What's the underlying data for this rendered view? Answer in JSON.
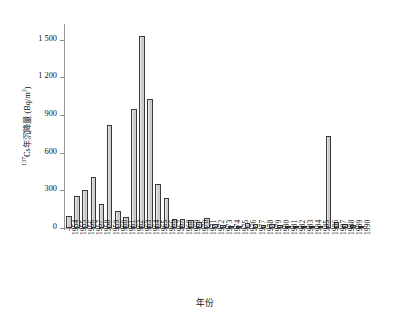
{
  "chart_data": {
    "type": "bar",
    "title": "",
    "xlabel": "年份",
    "ylabel": "¹³⁷Cs年沉降量 (Bq/m²)",
    "ylabel_parts": {
      "superscript": "137",
      "rest": "Cs年沉降量 (Bq/m",
      "unit_superscript": "2",
      "tail": ")"
    },
    "ylim": [
      0,
      1600
    ],
    "yticks": [
      0,
      300,
      600,
      900,
      1200,
      1500
    ],
    "ytick_labels": [
      "0",
      "300",
      "600",
      "900",
      "1 200",
      "1 500"
    ],
    "grid": false,
    "legend": null,
    "bar_fill_color": "#d2d2d2",
    "bar_edge_color": "#3a3a3a",
    "axis_color": "#9a9a9a",
    "categories": [
      "1954",
      "1955",
      "1956",
      "1957",
      "1958",
      "1959",
      "1960",
      "1961",
      "1962",
      "1963",
      "1964",
      "1965",
      "1966",
      "1967",
      "1968",
      "1969",
      "1970",
      "1971",
      "1972",
      "1973",
      "1974",
      "1975",
      "1976",
      "1977",
      "1978",
      "1979",
      "1980",
      "1981",
      "1982",
      "1983",
      "1984",
      "1985",
      "1986",
      "1987",
      "1988",
      "1989",
      "1990"
    ],
    "values": [
      95,
      255,
      300,
      405,
      195,
      820,
      135,
      85,
      950,
      1530,
      1030,
      350,
      240,
      70,
      75,
      60,
      45,
      80,
      30,
      25,
      20,
      18,
      40,
      30,
      22,
      28,
      25,
      20,
      18,
      16,
      14,
      12,
      730,
      45,
      30,
      22,
      18
    ],
    "units": "Bq/m²"
  }
}
